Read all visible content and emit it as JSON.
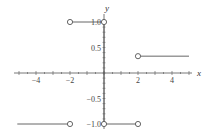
{
  "chart_data": {
    "type": "line",
    "title": "",
    "xlabel": "x",
    "ylabel": "y",
    "xlim": [
      -5.2,
      5.0
    ],
    "ylim": [
      -1.0,
      1.0
    ],
    "grid": false,
    "legend": null,
    "x_ticks": [
      -4,
      -2,
      2,
      4
    ],
    "x_tick_labels": [
      "−4",
      "−2",
      "2",
      "4"
    ],
    "y_ticks": [
      1.0,
      0.5,
      -0.5,
      -1.0
    ],
    "y_tick_labels": [
      "1.0",
      "0.5",
      "−0.5",
      "−1.0"
    ],
    "series": [
      {
        "name": "segment-1",
        "x": [
          -5.1,
          -2
        ],
        "y": [
          -1,
          -1
        ],
        "open_end": true
      },
      {
        "name": "segment-2",
        "x": [
          -2,
          0
        ],
        "y": [
          1,
          1
        ],
        "open_start": true,
        "closed_end": true
      },
      {
        "name": "vertical-at-0",
        "x": [
          0,
          0
        ],
        "y": [
          1,
          -1
        ]
      },
      {
        "name": "segment-3",
        "x": [
          0,
          2
        ],
        "y": [
          -1,
          -1
        ],
        "closed_start": true,
        "open_end": true
      },
      {
        "name": "segment-4",
        "x": [
          2,
          5
        ],
        "y": [
          0.33,
          0.33
        ],
        "open_start": true
      }
    ],
    "open_points": [
      {
        "x": -2,
        "y": -1
      },
      {
        "x": -2,
        "y": 1
      },
      {
        "x": 2,
        "y": -1
      },
      {
        "x": 2,
        "y": 0.33
      }
    ],
    "closed_points": [
      {
        "x": 0,
        "y": 1
      },
      {
        "x": 0,
        "y": -1
      }
    ]
  },
  "colors": {
    "line": "#555555",
    "axis": "#555555",
    "background": "#ffffff"
  }
}
